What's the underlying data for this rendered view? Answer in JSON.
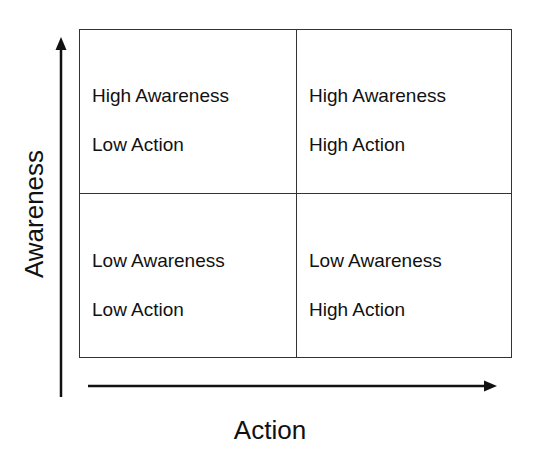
{
  "diagram": {
    "type": "2x2 matrix",
    "axes": {
      "y": {
        "label": "Awareness",
        "direction": "up"
      },
      "x": {
        "label": "Action",
        "direction": "right"
      }
    },
    "quadrants": {
      "top_left": {
        "line1": "High Awareness",
        "line2": "Low Action"
      },
      "top_right": {
        "line1": "High Awareness",
        "line2": "High Action"
      },
      "bottom_left": {
        "line1": "Low Awareness",
        "line2": "Low Action"
      },
      "bottom_right": {
        "line1": "Low Awareness",
        "line2": "High Action"
      }
    },
    "colors": {
      "line": "#333333",
      "text": "#111111",
      "background": "#ffffff"
    }
  }
}
